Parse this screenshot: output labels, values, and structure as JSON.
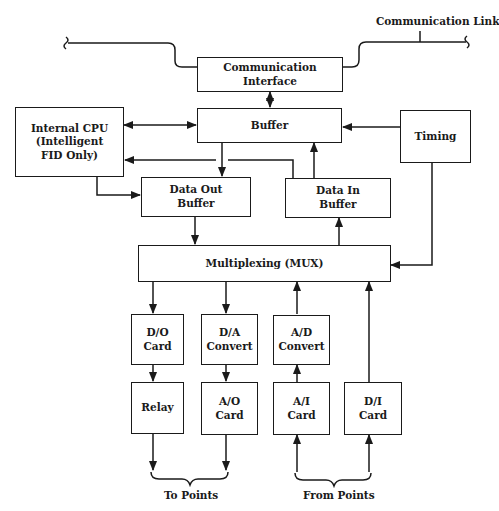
{
  "diagram": {
    "colors": {
      "line": "#1a1a1a",
      "background": "#ffffff"
    },
    "labels": {
      "comm_link": "Communication Link",
      "to_points": "To Points",
      "from_points": "From Points"
    },
    "boxes": {
      "comm_interface": "Communication\nInterface",
      "buffer": "Buffer",
      "cpu": "Internal CPU\n(Intelligent\nFID Only)",
      "timing": "Timing",
      "data_out": "Data Out\nBuffer",
      "data_in": "Data In\nBuffer",
      "mux": "Multiplexing (MUX)",
      "do_card": "D/O\nCard",
      "da_convert": "D/A\nConvert",
      "ad_convert": "A/D\nConvert",
      "relay": "Relay",
      "ao_card": "A/O\nCard",
      "ai_card": "A/I\nCard",
      "di_card": "D/I\nCard"
    }
  }
}
